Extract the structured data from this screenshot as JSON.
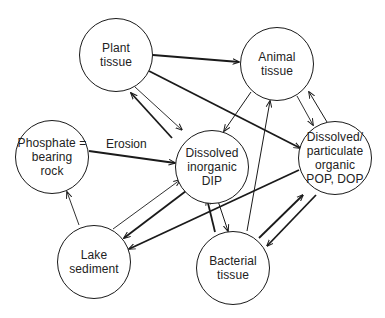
{
  "diagram": {
    "nodes": {
      "plant": {
        "lines": [
          "Plant",
          "tissue"
        ]
      },
      "animal": {
        "lines": [
          "Animal",
          "tissue"
        ]
      },
      "phosphate": {
        "lines": [
          "Phosphate =",
          "bearing",
          "rock"
        ]
      },
      "dip": {
        "lines": [
          "Dissolved",
          "inorganic",
          "DIP"
        ]
      },
      "organic": {
        "lines": [
          "Dissolved/",
          "particulate",
          "organic",
          "POP, DOP"
        ]
      },
      "lake": {
        "lines": [
          "Lake",
          "sediment"
        ]
      },
      "bacterial": {
        "lines": [
          "Bacterial",
          "tissue"
        ]
      }
    },
    "edge_labels": {
      "erosion": "Erosion"
    },
    "edges": [
      {
        "from": "Plant tissue",
        "to": "Animal tissue",
        "weight": "thick"
      },
      {
        "from": "Plant tissue",
        "to": "Dissolved/particulate organic",
        "weight": "thick"
      },
      {
        "from": "Plant tissue",
        "to": "Dissolved inorganic DIP",
        "weight": "thin"
      },
      {
        "from": "Dissolved inorganic DIP",
        "to": "Plant tissue",
        "weight": "thick"
      },
      {
        "from": "Animal tissue",
        "to": "Dissolved inorganic DIP",
        "weight": "thin"
      },
      {
        "from": "Animal tissue",
        "to": "Dissolved/particulate organic",
        "weight": "thin"
      },
      {
        "from": "Dissolved/particulate organic",
        "to": "Animal tissue",
        "weight": "thin"
      },
      {
        "from": "Phosphate = bearing rock",
        "to": "Dissolved inorganic DIP",
        "weight": "thick",
        "label": "Erosion"
      },
      {
        "from": "Lake sediment",
        "to": "Phosphate = bearing rock",
        "weight": "thin"
      },
      {
        "from": "Lake sediment",
        "to": "Dissolved inorganic DIP",
        "weight": "thin"
      },
      {
        "from": "Dissolved inorganic DIP",
        "to": "Lake sediment",
        "weight": "thick"
      },
      {
        "from": "Dissolved/particulate organic",
        "to": "Lake sediment",
        "weight": "thick"
      },
      {
        "from": "Bacterial tissue",
        "to": "Dissolved inorganic DIP",
        "weight": "thick"
      },
      {
        "from": "Dissolved inorganic DIP",
        "to": "Bacterial tissue",
        "weight": "thin"
      },
      {
        "from": "Bacterial tissue",
        "to": "Animal tissue",
        "weight": "thin"
      },
      {
        "from": "Bacterial tissue",
        "to": "Dissolved/particulate organic",
        "weight": "thick"
      },
      {
        "from": "Dissolved/particulate organic",
        "to": "Bacterial tissue",
        "weight": "thick"
      }
    ]
  }
}
